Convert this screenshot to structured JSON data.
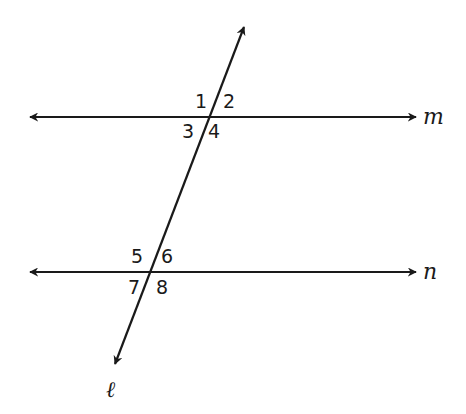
{
  "diagram": {
    "type": "parallel-lines-cut-by-transversal",
    "lines": {
      "m": {
        "label": "m",
        "y": 117,
        "x1": 28,
        "x2": 418
      },
      "n": {
        "label": "n",
        "y": 272,
        "x1": 28,
        "x2": 418
      },
      "transversal": {
        "label": "ℓ",
        "x1": 245,
        "y1": 25,
        "x2": 115,
        "y2": 365
      }
    },
    "angles": {
      "a1": "1",
      "a2": "2",
      "a3": "3",
      "a4": "4",
      "a5": "5",
      "a6": "6",
      "a7": "7",
      "a8": "8"
    },
    "colors": {
      "stroke": "#1a1a1a",
      "background": "#ffffff"
    }
  }
}
